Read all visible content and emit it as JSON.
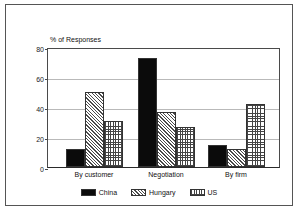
{
  "chart_data": {
    "type": "bar",
    "title": "",
    "subtitle": "",
    "ylabel": "% of Responses",
    "xlabel": "",
    "categories": [
      "By customer",
      "Negotiation",
      "By firm"
    ],
    "series": [
      {
        "name": "China",
        "values": [
          12,
          73,
          15
        ],
        "pattern": "solid-black",
        "color": "#0b0b0b"
      },
      {
        "name": "Hungary",
        "values": [
          50,
          37,
          12
        ],
        "pattern": "diagonal-hatch",
        "color": "#4a4a4a"
      },
      {
        "name": "US",
        "values": [
          31,
          27,
          42
        ],
        "pattern": "cross-hatch",
        "color": "#444444"
      }
    ],
    "ylim": [
      0,
      80
    ],
    "yticks": [
      0,
      20,
      40,
      60,
      80
    ],
    "ytick_labels": [
      "0",
      "20",
      "40",
      "60",
      "80"
    ],
    "grid": true,
    "grid_axis": "y",
    "legend_position": "bottom",
    "legend_entries": [
      "China",
      "Hungary",
      "US"
    ]
  },
  "axis": {
    "y_label": "% of Responses",
    "tick_0": "0",
    "tick_1": "20",
    "tick_2": "40",
    "tick_3": "60",
    "tick_4": "80"
  },
  "legend": {
    "china": "China",
    "hungary": "Hungary",
    "us": "US"
  },
  "categories": {
    "c0": "By customer",
    "c1": "Negotiation",
    "c2": "By firm"
  }
}
